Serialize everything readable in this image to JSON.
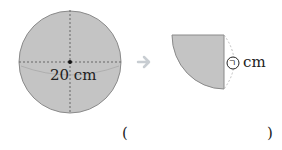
{
  "figure": {
    "circle_label": "20 cm",
    "sector_label_symbol": "ㄱ",
    "sector_label_unit": "cm",
    "arrow": "➔",
    "answer_open": "(",
    "answer_close": ")",
    "fill_color": "#c4c4c4",
    "stroke_color": "#8a8a8a",
    "arrow_color": "#c8cdd2"
  }
}
